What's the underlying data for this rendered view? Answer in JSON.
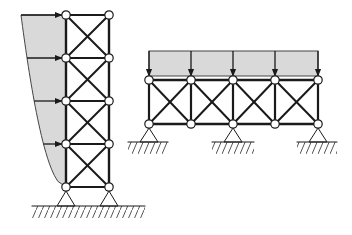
{
  "diagram": {
    "title": "",
    "colors": {
      "background": "#ffffff",
      "member": "#1a1a1a",
      "load_fill": "#d9d9d9",
      "load_stroke": "#444444",
      "node_fill": "#ffffff",
      "hatch": "#555555"
    },
    "tower": {
      "label": "",
      "columns_x": [
        66,
        109
      ],
      "levels_y": [
        15,
        58,
        101,
        144,
        187
      ],
      "load": {
        "type": "lateral-distributed-parabolic",
        "top_left": [
          21,
          15
        ],
        "arrow_levels_y": [
          15,
          58,
          101,
          144
        ]
      },
      "supports": [
        {
          "type": "pin",
          "x": 66,
          "y": 187
        },
        {
          "type": "pin",
          "x": 109,
          "y": 187
        }
      ],
      "ground": {
        "x1": 32,
        "x2": 145,
        "y": 206
      }
    },
    "frame": {
      "label": "",
      "nodes_x": [
        149,
        191,
        233,
        275,
        318
      ],
      "top_y": 80,
      "bottom_y": 124,
      "load": {
        "type": "uniform-distributed-vertical",
        "top_y": 51,
        "bottom_y": 76,
        "arrow_x": [
          149,
          191,
          233,
          275,
          318
        ]
      },
      "supports": [
        {
          "type": "pin",
          "x": 149,
          "y": 124,
          "ground": {
            "x1": 128,
            "x2": 168,
            "y": 142
          }
        },
        {
          "type": "pin",
          "x": 233,
          "y": 124,
          "ground": {
            "x1": 212,
            "x2": 254,
            "y": 142
          }
        },
        {
          "type": "pin",
          "x": 318,
          "y": 124,
          "ground": {
            "x1": 297,
            "x2": 337,
            "y": 142
          }
        }
      ]
    }
  }
}
